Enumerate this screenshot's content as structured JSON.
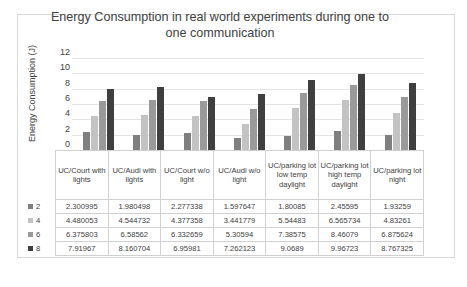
{
  "chart": {
    "title": "Energy Consumption in real world experiments during one to one communication",
    "y_axis_title": "Energy Consumption (J)"
  },
  "chart_data": {
    "type": "bar",
    "title": "Energy Consumption in real world experiments during one to one communication",
    "xlabel": "",
    "ylabel": "Energy Consumption (J)",
    "ylim": [
      0,
      12
    ],
    "yticks": [
      "0",
      "2",
      "4",
      "6",
      "8",
      "10",
      "12"
    ],
    "grid": true,
    "legend_position": "data-table-left",
    "categories": [
      "UC/Court with lights",
      "UC/Audi with lights",
      "UC/Court w/o light",
      "UC/Audi w/o light",
      "UC/parking lot low temp daylight",
      "UC/parking lot high temp daylight",
      "UC/parking lot  night"
    ],
    "series": [
      {
        "name": "2",
        "color": "#7f7f7f",
        "values": [
          2.300995,
          1.980498,
          2.277338,
          1.597647,
          1.80085,
          2.45595,
          1.93259
        ],
        "labels": [
          "2.300995",
          "1.980498",
          "2.277338",
          "1.597647",
          "1.80085",
          "2.45595",
          "1.93259"
        ]
      },
      {
        "name": "4",
        "color": "#c3c3c3",
        "values": [
          4.480053,
          4.544732,
          4.377358,
          3.441779,
          5.54483,
          6.565734,
          4.83261
        ],
        "labels": [
          "4.480053",
          "4.544732",
          "4.377358",
          "3.441779",
          "5.54483",
          "6.565734",
          "4.83261"
        ]
      },
      {
        "name": "6",
        "color": "#9a9a9a",
        "values": [
          6.375803,
          6.58562,
          6.332659,
          5.30594,
          7.38575,
          8.46079,
          6.875624
        ],
        "labels": [
          "6.375803",
          "6.58562",
          "6.332659",
          "5.30594",
          "7.38575",
          "8.46079",
          "6.875624"
        ]
      },
      {
        "name": "8",
        "color": "#3f3f3f",
        "values": [
          7.91967,
          8.160704,
          6.95981,
          7.262123,
          9.0689,
          9.96723,
          8.767325
        ],
        "labels": [
          "7.91967",
          "8.160704",
          "6.95981",
          "7.262123",
          "9.0689",
          "9.96723",
          "8.767325"
        ]
      }
    ]
  }
}
